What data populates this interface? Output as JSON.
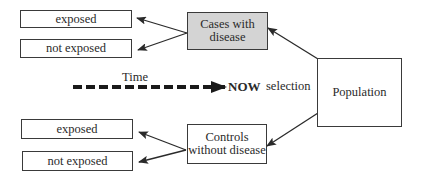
{
  "diagram": {
    "type": "case-control study design",
    "nodes": {
      "cases": "Cases with disease",
      "cases_line1": "Cases with",
      "cases_line2": "disease",
      "controls_line1": "Controls",
      "controls_line2": "without disease",
      "population": "Population",
      "cases_exposed": "exposed",
      "cases_not_exposed": "not exposed",
      "controls_exposed": "exposed",
      "controls_not_exposed": "not exposed"
    },
    "labels": {
      "time": "Time",
      "now": "NOW",
      "selection": "selection"
    },
    "edges": [
      {
        "from": "population",
        "to": "cases"
      },
      {
        "from": "population",
        "to": "controls"
      },
      {
        "from": "cases",
        "to": "cases_exposed"
      },
      {
        "from": "cases",
        "to": "cases_not_exposed"
      },
      {
        "from": "controls",
        "to": "controls_exposed"
      },
      {
        "from": "controls",
        "to": "controls_not_exposed"
      },
      {
        "from": "time",
        "to": "now",
        "style": "dashed"
      }
    ],
    "colors": {
      "cases_fill": "#d4d4d4",
      "stroke": "#3a3a3a"
    }
  }
}
